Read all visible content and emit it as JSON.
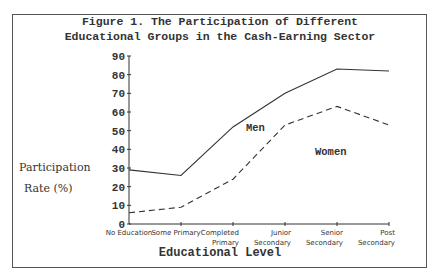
{
  "figure": {
    "title_line1": "Figure 1. The Participation of Different",
    "title_line2": "Educational Groups in the Cash-Earning Sector",
    "ylabel_line1": "Participation",
    "ylabel_line2": "Rate (%)",
    "xlabel": "Educational Level",
    "series_labels": {
      "men": "Men",
      "women": "Women"
    }
  },
  "chart_data": {
    "type": "line",
    "xlabel": "Educational Level",
    "ylabel": "Participation Rate (%)",
    "categories": [
      "No Education",
      "Some Primary",
      "Completed Primary",
      "Junior Secondary",
      "Senior Secondary",
      "Post Secondary"
    ],
    "y_ticks": [
      0,
      10,
      20,
      30,
      40,
      50,
      60,
      70,
      80,
      90
    ],
    "ylim": [
      0,
      90
    ],
    "grid": false,
    "legend": "inline labels on plot",
    "series": [
      {
        "name": "Men",
        "style": "solid",
        "values": [
          29,
          26,
          52,
          70,
          83,
          82
        ]
      },
      {
        "name": "Women",
        "style": "dashed",
        "values": [
          6,
          9,
          24,
          53,
          63,
          53
        ]
      }
    ]
  }
}
